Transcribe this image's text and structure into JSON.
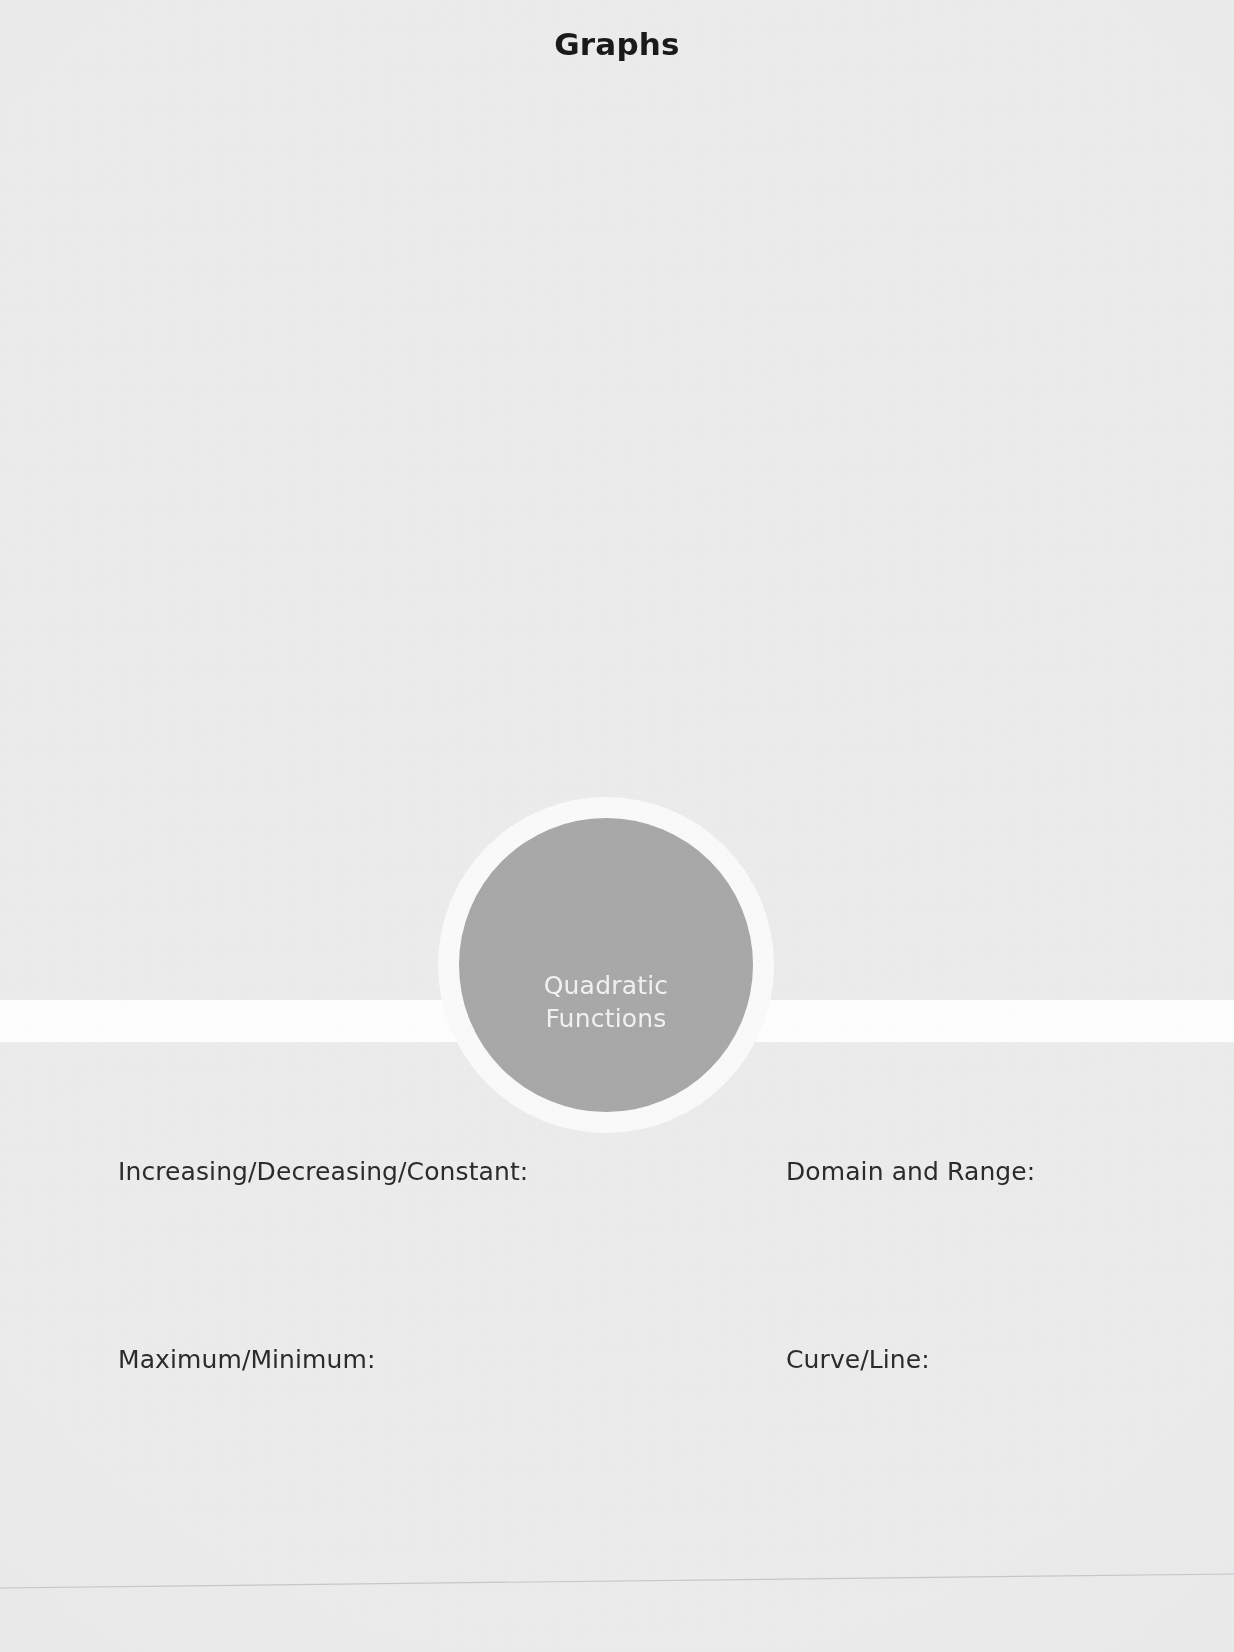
{
  "document": {
    "title": "Graphs",
    "type": "graphic-organizer-worksheet"
  },
  "center_node": {
    "line1": "Quadratic",
    "line2": "Functions",
    "shape": "circle",
    "fill_color": "#a9a9a9",
    "ring_color": "#fbfbfb",
    "text_color": "#f3f3f3"
  },
  "fields": {
    "top_left": "Increasing/Decreasing/Constant:",
    "top_right": "Domain and Range:",
    "bottom_left": "Maximum/Minimum:",
    "bottom_right": "Curve/Line:"
  },
  "panels": {
    "top": {
      "name": "upper-folder-panel",
      "fill": "#ededee"
    },
    "bottom": {
      "name": "lower-folder-panel",
      "fill": "#ededee"
    }
  },
  "colors": {
    "page_background": "#ffffff",
    "panel_fill": "#ededee",
    "title_text": "#1a1a1a",
    "label_text": "#2b2b2b"
  }
}
